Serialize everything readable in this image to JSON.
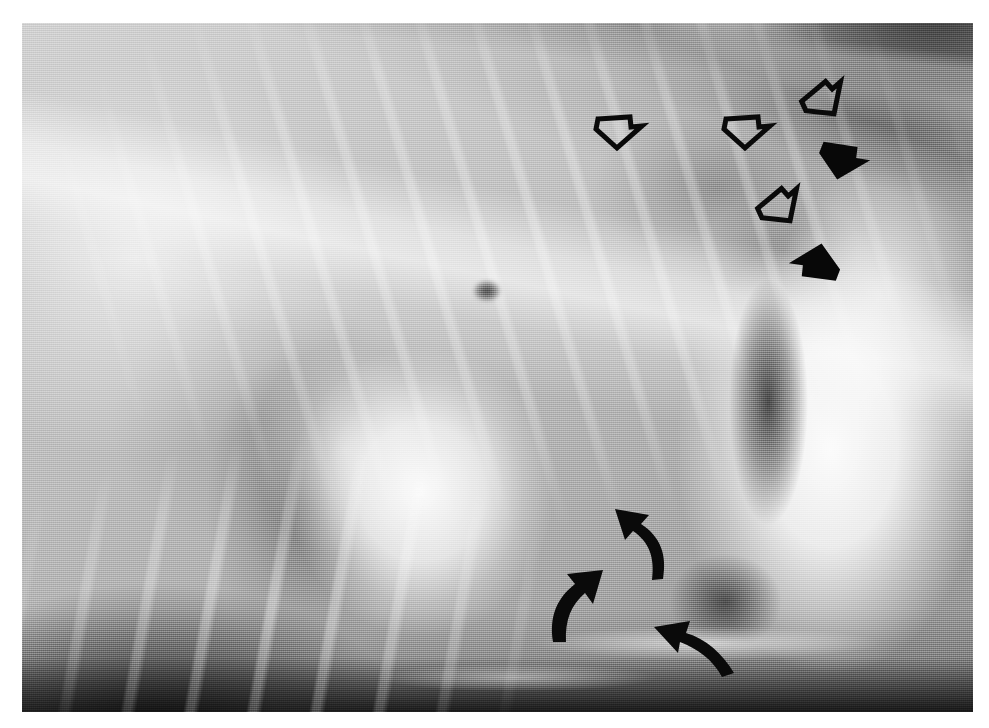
{
  "image": {
    "kind": "radiograph",
    "modality": "x-ray",
    "view": "lateral thorax",
    "width": 989,
    "height": 728,
    "border": {
      "color": "#ffffff",
      "left": 22,
      "top": 23,
      "right": 16,
      "bottom": 16
    },
    "plate": {
      "left": 22,
      "top": 23,
      "width": 951,
      "height": 689
    },
    "palette": {
      "film_light": "#e8e8e8",
      "film_mid": "#b4b4b4",
      "film_dark": "#2a2a2a",
      "opacity_white": "#ffffff",
      "annotation_black": "#080808",
      "page_background": "#ffffff"
    }
  },
  "anatomy": [
    {
      "name": "lung-field-cranial",
      "description": "bright lucent cranial lung field, left half of plate"
    },
    {
      "name": "rib-cage",
      "description": "repeating oblique rib shadows across dorsal thorax"
    },
    {
      "name": "vertebral-column",
      "description": "thoracic spine running from upper-left toward upper-right"
    },
    {
      "name": "cardiac-silhouette",
      "description": "rounded white soft-tissue opacity, center of plate"
    },
    {
      "name": "diaphragm-liver-opacity",
      "description": "large white opacity occupying caudal right portion"
    },
    {
      "name": "gas-shadow",
      "description": "dark vertical lucency between heart and diaphragm"
    },
    {
      "name": "interstitial-infiltrate",
      "description": "hazy increased opacity in caudodorsal lung marked by hollow arrows"
    },
    {
      "name": "hilar-marking",
      "description": "small dark focal hilar/carinal shadow near center"
    },
    {
      "name": "sternal-ribs",
      "description": "ventral rib shadows in lower-left quadrant"
    }
  ],
  "annotations": {
    "legend_note": "markers drawn on the film; no text labels are present in the image",
    "counts": {
      "hollow_arrows": 4,
      "solid_arrows": 2,
      "curved_arrows": 3,
      "total": 9
    },
    "markers": [
      {
        "id": "hollow-arrow-1",
        "style": "hollow",
        "shape": "block-arrow",
        "direction": "down",
        "x": 620,
        "y": 131,
        "rotation": 0,
        "points_at": "caudodorsal lung infiltrate"
      },
      {
        "id": "hollow-arrow-2",
        "style": "hollow",
        "shape": "block-arrow",
        "direction": "down",
        "x": 748,
        "y": 131,
        "rotation": 0,
        "points_at": "caudodorsal lung infiltrate"
      },
      {
        "id": "hollow-arrow-3",
        "style": "hollow",
        "shape": "block-arrow",
        "direction": "down-left",
        "x": 830,
        "y": 103,
        "rotation": 35,
        "points_at": "dorsal lung margin"
      },
      {
        "id": "hollow-arrow-4",
        "style": "hollow",
        "shape": "block-arrow",
        "direction": "down-left",
        "x": 786,
        "y": 210,
        "rotation": 35,
        "points_at": "caudal lung border"
      },
      {
        "id": "solid-arrow-1",
        "style": "solid",
        "shape": "block-arrow",
        "direction": "down-right",
        "x": 845,
        "y": 164,
        "rotation": -18,
        "points_at": "pleural fissure line"
      },
      {
        "id": "solid-arrow-2",
        "style": "solid",
        "shape": "block-arrow",
        "direction": "up-right",
        "x": 814,
        "y": 259,
        "rotation": 160,
        "points_at": "caudal lung lobe edge"
      },
      {
        "id": "curved-arrow-1",
        "style": "solid",
        "shape": "curved-arrow",
        "direction": "up-left",
        "x": 645,
        "y": 543,
        "rotation": 0,
        "points_at": "caudal vena cava / cardiac border"
      },
      {
        "id": "curved-arrow-2",
        "style": "solid",
        "shape": "curved-arrow",
        "direction": "up-right",
        "x": 585,
        "y": 604,
        "rotation": 0,
        "points_at": "cardiac apex / diaphragm contact"
      },
      {
        "id": "curved-arrow-3",
        "style": "solid",
        "shape": "curved-arrow",
        "direction": "up-left",
        "x": 693,
        "y": 638,
        "rotation": 0,
        "points_at": "diaphragmatic crus"
      }
    ]
  }
}
